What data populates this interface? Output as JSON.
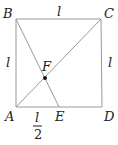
{
  "diagram": {
    "type": "geometry-square",
    "line_color": "#9a9a9a",
    "text_color": "#222222",
    "points": {
      "A": {
        "label": "A",
        "x": 16,
        "y": 107
      },
      "B": {
        "label": "B",
        "x": 16,
        "y": 19
      },
      "C": {
        "label": "C",
        "x": 101,
        "y": 19
      },
      "D": {
        "label": "D",
        "x": 102,
        "y": 107
      },
      "E": {
        "label": "E",
        "x": 59,
        "y": 107
      },
      "F": {
        "label": "F",
        "x": 45,
        "y": 78
      }
    },
    "side_labels": {
      "top": "l",
      "left": "l",
      "right": "l",
      "bottom_numerator": "l",
      "bottom_denominator": "2"
    },
    "segments": [
      "AB",
      "BC",
      "CD",
      "DA",
      "AC",
      "BE"
    ]
  }
}
